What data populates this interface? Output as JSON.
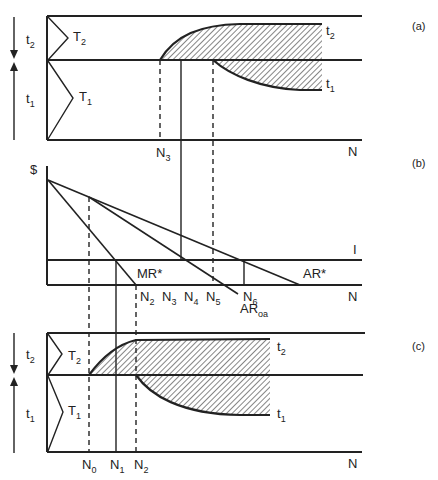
{
  "panels": {
    "a": {
      "tag": "(a)",
      "t2": "t",
      "t2_sub": "2",
      "t1": "t",
      "t1_sub": "1",
      "T2": "T",
      "T2_sub": "2",
      "T1": "T",
      "T1_sub": "1",
      "curve_t2": "t",
      "curve_t2_sub": "2",
      "curve_t1": "t",
      "curve_t1_sub": "1",
      "n3": "N",
      "n3_sub": "3",
      "axis_n": "N"
    },
    "b": {
      "tag": "(b)",
      "dollar": "$",
      "I": "I",
      "mr": "MR*",
      "ar": "AR*",
      "ar_oa": "AR",
      "ar_oa_sub": "oa",
      "axis_n": "N",
      "ticks": [
        {
          "label": "N",
          "sub": "2"
        },
        {
          "label": "N",
          "sub": "3"
        },
        {
          "label": "N",
          "sub": "4"
        },
        {
          "label": "N",
          "sub": "5"
        },
        {
          "label": "N",
          "sub": "6"
        }
      ]
    },
    "c": {
      "tag": "(c)",
      "t2": "t",
      "t2_sub": "2",
      "t1": "t",
      "t1_sub": "1",
      "T2": "T",
      "T2_sub": "2",
      "T1": "T",
      "T1_sub": "1",
      "curve_t2": "t",
      "curve_t2_sub": "2",
      "curve_t1": "t",
      "curve_t1_sub": "1",
      "axis_n": "N",
      "ticks": [
        {
          "label": "N",
          "sub": "0"
        },
        {
          "label": "N",
          "sub": "1"
        },
        {
          "label": "N",
          "sub": "2"
        }
      ]
    }
  },
  "colors": {
    "ink": "#222222",
    "background": "#ffffff"
  }
}
